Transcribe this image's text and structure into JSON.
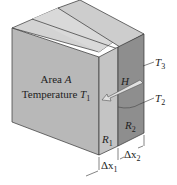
{
  "figure": {
    "type": "composite-slab-heat-conduction",
    "front_face": {
      "line1": "Area A",
      "line1_plain": "Area ",
      "line1_var": "A",
      "line2_plain": "Temperature ",
      "line2_var": "T",
      "line2_sub": "1"
    },
    "arrow": {
      "label": "H",
      "direction": "toward front-left"
    },
    "layers": [
      {
        "name": "R",
        "sub": "1",
        "thickness_label": "Δx",
        "thickness_sub": "1"
      },
      {
        "name": "R",
        "sub": "2",
        "thickness_label": "Δx",
        "thickness_sub": "2"
      }
    ],
    "temperatures": [
      {
        "var": "T",
        "sub": "3"
      },
      {
        "var": "T",
        "sub": "2"
      }
    ],
    "colors": {
      "front_face": "#b9b9b9",
      "top_face": "#d6d6d6",
      "slab1_side": "#c3c3c3",
      "slab2_side": "#8f8f8f",
      "edge": "#333333",
      "arrow_fill": "#d9d9d9"
    }
  }
}
